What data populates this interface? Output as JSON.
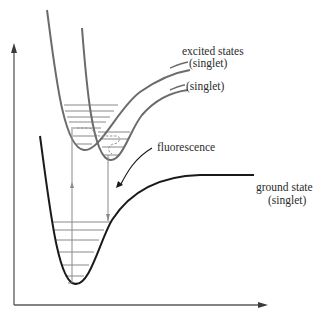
{
  "diagram": {
    "type": "jablonski-potential-energy-curves",
    "colors": {
      "ground_curve": "#1a1a1a",
      "excited_curves": "#6b6b6b",
      "vibrational_levels": "#7a7a7a",
      "transition_arrows": "#8a8a8a",
      "axes": "#5a5a5a",
      "text": "#2b2b2b"
    },
    "labels": {
      "excited_states_line1": "excited states",
      "excited_states_line2": "(singlet)",
      "second_excited": "(singlet)",
      "fluorescence": "fluorescence",
      "ground_state_line1": "ground state",
      "ground_state_line2": "(singlet)"
    },
    "axes": {
      "y_axis": "energy (unlabeled arrow)",
      "x_axis": "internuclear distance (unlabeled arrow)"
    },
    "curves": [
      {
        "name": "ground state",
        "vibrational_levels": 7
      },
      {
        "name": "excited state 1",
        "vibrational_levels": 7
      },
      {
        "name": "excited state 2",
        "vibrational_levels": 4
      }
    ],
    "transitions": [
      "absorption (up arrow)",
      "vibrational relaxation (dashed)",
      "fluorescence (down arrow)"
    ]
  }
}
